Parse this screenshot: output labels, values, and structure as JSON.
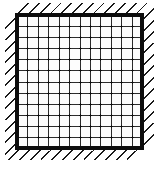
{
  "figure": {
    "type": "technical-diagram",
    "canvas": {
      "width": 158,
      "height": 169,
      "background": "#ffffff"
    },
    "plate": {
      "name": "square-mesh-plate",
      "x": 15,
      "y": 13,
      "width": 129,
      "height": 137,
      "border_color": "#0d0d0d",
      "border_width": 4,
      "fill": "#fdfdfd"
    },
    "mesh": {
      "name": "grid-mesh",
      "columns": 12,
      "rows": 12,
      "line_color": "#2c2c2c",
      "line_width": 1.6,
      "node_color": "#111111",
      "node_radius": 1.1,
      "show_nodes": true
    },
    "hatching": {
      "name": "fixed-support-hatching",
      "sides": [
        "top",
        "right",
        "bottom",
        "left"
      ],
      "angle_deg": 45,
      "direction": "up-right",
      "length": 14,
      "spacing": 11,
      "color": "#1a1a1a",
      "line_width": 1.4,
      "count_top": 12,
      "count_bottom": 12,
      "count_left": 12,
      "count_right": 12
    }
  }
}
